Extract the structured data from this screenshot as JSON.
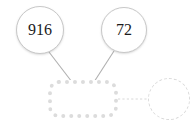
{
  "diagram": {
    "background_color": "#ffffff",
    "edge_color": "#b0b0b0",
    "ghost_color": "#d9d9d9",
    "node_border_color": "#c8c8c8",
    "rect_border_color": "#dcdcdc",
    "text_color": "#1c1c1c",
    "nodes": {
      "circle_left": {
        "label": "916",
        "cx": 40,
        "cy": 30,
        "r": 24,
        "style": "solid"
      },
      "circle_right": {
        "label": "72",
        "cx": 124,
        "cy": 30,
        "r": 23,
        "style": "solid"
      },
      "rect_center": {
        "label": "",
        "x": 48,
        "y": 80,
        "width": 70,
        "height": 38,
        "style": "dotted"
      },
      "circle_ghost": {
        "label": "",
        "cx": 169,
        "cy": 99,
        "r": 21,
        "style": "dashed"
      }
    },
    "edges": [
      {
        "from": "circle_left",
        "to": "rect_center",
        "style": "solid",
        "x1": 49,
        "y1": 52,
        "x2": 72,
        "y2": 82
      },
      {
        "from": "circle_right",
        "to": "rect_center",
        "style": "solid",
        "x1": 114,
        "y1": 51,
        "x2": 94,
        "y2": 82
      },
      {
        "from": "rect_center",
        "to": "circle_ghost",
        "style": "dashed",
        "x1": 118,
        "y1": 99,
        "x2": 148,
        "y2": 99
      }
    ]
  }
}
